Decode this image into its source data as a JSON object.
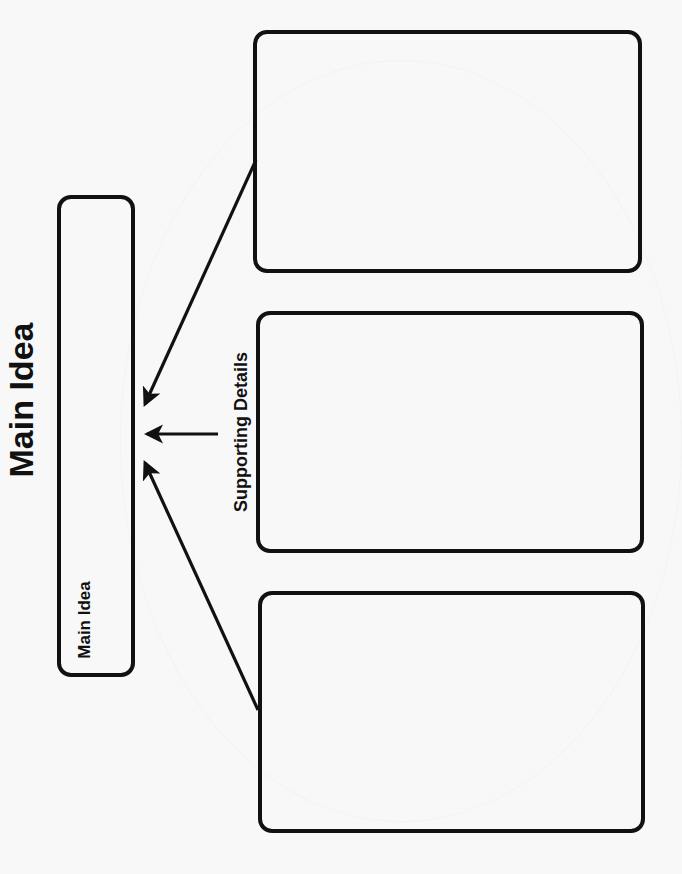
{
  "worksheet": {
    "title": "Main Idea",
    "main_idea_box": {
      "label": "Main Idea",
      "content": ""
    },
    "supporting_details_label": "Supporting Details",
    "detail_boxes": [
      {
        "content": ""
      },
      {
        "content": ""
      },
      {
        "content": ""
      }
    ],
    "arrows": [
      {
        "from": "detail-box-1",
        "to": "main-idea-box"
      },
      {
        "from": "supporting-details-label",
        "to": "main-idea-box"
      },
      {
        "from": "detail-box-3",
        "to": "main-idea-box"
      }
    ],
    "orientation": "rotated -90deg (landscape printed on portrait)"
  },
  "colors": {
    "background": "#f8f8f8",
    "stroke": "#111111",
    "text": "#111111"
  }
}
